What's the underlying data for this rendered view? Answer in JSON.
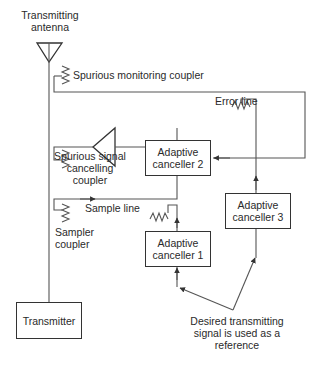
{
  "diagram": {
    "antenna": {
      "label_line1": "Transmitting",
      "label_line2": "antenna",
      "icon": "antenna-icon"
    },
    "couplers": {
      "spurious_monitoring": "Spurious monitoring coupler",
      "spurious_cancelling_line1": "Spurious signal",
      "spurious_cancelling_line2": "cancelling",
      "spurious_cancelling_line3": "coupler",
      "sampler_line1": "Sampler",
      "sampler_line2": "coupler"
    },
    "lines": {
      "error_line": "Error line",
      "sample_line": "Sample line"
    },
    "blocks": {
      "transmitter": "Transmitter",
      "canceller_1_line1": "Adaptive",
      "canceller_1_line2": "canceller 1",
      "canceller_2_line1": "Adaptive",
      "canceller_2_line2": "canceller 2",
      "canceller_3_line1": "Adaptive",
      "canceller_3_line2": "canceller 3"
    },
    "reference_note": {
      "line1": "Desired transmitting",
      "line2": "signal is used as a",
      "line3": "reference"
    },
    "colors": {
      "line": "#555555",
      "box_border": "#333333",
      "text": "#2a2a2a"
    }
  }
}
